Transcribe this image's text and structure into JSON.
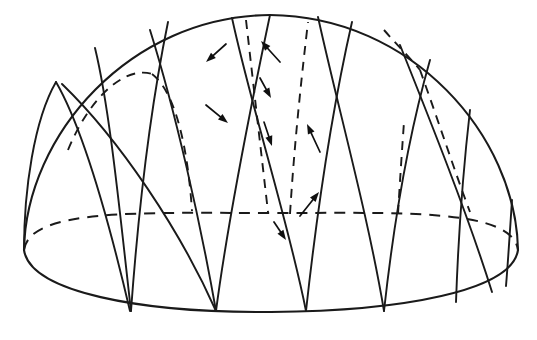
{
  "figure": {
    "background_color": "#ffffff",
    "ink_color": "#1a1a1a",
    "width": 537,
    "height": 340
  },
  "geometry": {
    "dome": {
      "apex": {
        "x": 270,
        "y": 15
      },
      "left_extreme": {
        "x": 24,
        "y": 250
      },
      "right_extreme": {
        "x": 518,
        "y": 250
      },
      "base_center": {
        "x": 271,
        "y": 312
      },
      "dome_outline_path": "M 24 250 C 26 135 130 16 270 15 C 412 16 516 136 518 250",
      "base_rim_path": "M 24 250 C 30 292 140 313 271 312 C 402 311 512 291 518 250"
    },
    "equator": {
      "label": "equator-ellipse",
      "style": "dashed",
      "path": "M 24 250 C 30 208 140 213 271 213 C 402 213 512 208 518 250"
    },
    "visible_arcs": [
      {
        "name": "arc-v1",
        "path": "M 24 250 C 24 190 34 120 56 82"
      },
      {
        "name": "arc-v2",
        "path": "M 56 82 C 78 120 104 200 130 311"
      },
      {
        "name": "arc-v3",
        "path": "M 95 48 C 110 110 120 215 131 311"
      },
      {
        "name": "arc-v4",
        "path": "M 62 84 C 120 140 180 230 216 311"
      },
      {
        "name": "arc-v5",
        "path": "M 168 22 C 150 110 138 215 131 311"
      },
      {
        "name": "arc-v6",
        "path": "M 150 30 C 175 110 200 220 216 311"
      },
      {
        "name": "arc-v7",
        "path": "M 270 15 C 250 110 228 220 216 311"
      },
      {
        "name": "arc-v8",
        "path": "M 232 18 C 252 110 288 220 306 311"
      },
      {
        "name": "arc-v9",
        "path": "M 352 22 C 332 110 316 220 306 311"
      },
      {
        "name": "arc-v10",
        "path": "M 318 17 C 338 108 368 215 384 311"
      },
      {
        "name": "arc-v11",
        "path": "M 430 60 C 410 130 394 220 384 311"
      },
      {
        "name": "arc-v12",
        "path": "M 400 45 C 430 120 468 215 492 292"
      },
      {
        "name": "arc-v13",
        "path": "M 470 110 C 462 180 458 245 456 302"
      },
      {
        "name": "arc-v14",
        "path": "M 512 200 C 510 230 508 262 506 286"
      }
    ],
    "hidden_arcs": [
      {
        "name": "arc-h1",
        "path": "M 68 150 C 92 92 128 66 152 74"
      },
      {
        "name": "arc-h2",
        "path": "M 152 74 C 176 92 188 150 192 211"
      },
      {
        "name": "arc-h3",
        "path": "M 246 20 C 254 90 262 160 268 212"
      },
      {
        "name": "arc-h4",
        "path": "M 290 214 C 294 150 300 90 308 22"
      },
      {
        "name": "arc-h5",
        "path": "M 384 30 C 398 46 412 60 420 70"
      },
      {
        "name": "arc-h6",
        "path": "M 420 70 C 438 120 456 175 470 212"
      },
      {
        "name": "arc-h7",
        "path": "M 398 214 C 400 180 402 150 404 122"
      }
    ],
    "arrows": [
      {
        "name": "arrow-1",
        "tail": {
          "x": 226,
          "y": 44
        },
        "head": {
          "x": 206,
          "y": 62
        },
        "direction": "down-left"
      },
      {
        "name": "arrow-2",
        "tail": {
          "x": 280,
          "y": 62
        },
        "head": {
          "x": 261,
          "y": 41
        },
        "direction": "up-left"
      },
      {
        "name": "arrow-3",
        "tail": {
          "x": 260,
          "y": 78
        },
        "head": {
          "x": 271,
          "y": 98
        },
        "direction": "down-right"
      },
      {
        "name": "arrow-4",
        "tail": {
          "x": 206,
          "y": 105
        },
        "head": {
          "x": 228,
          "y": 123
        },
        "direction": "down-right"
      },
      {
        "name": "arrow-5",
        "tail": {
          "x": 264,
          "y": 122
        },
        "head": {
          "x": 272,
          "y": 146
        },
        "direction": "down"
      },
      {
        "name": "arrow-6",
        "tail": {
          "x": 320,
          "y": 152
        },
        "head": {
          "x": 307,
          "y": 124
        },
        "direction": "up-left"
      },
      {
        "name": "arrow-7",
        "tail": {
          "x": 300,
          "y": 216
        },
        "head": {
          "x": 319,
          "y": 192
        },
        "direction": "up-right"
      },
      {
        "name": "arrow-8",
        "tail": {
          "x": 274,
          "y": 222
        },
        "head": {
          "x": 286,
          "y": 240
        },
        "direction": "down-right"
      }
    ]
  }
}
